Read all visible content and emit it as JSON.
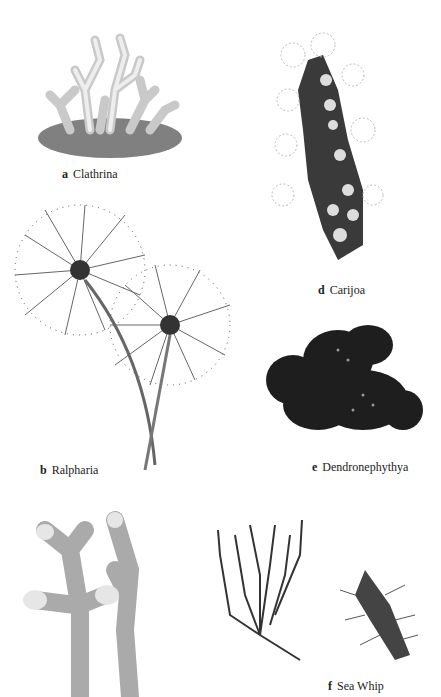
{
  "plates": [
    {
      "letter": "a",
      "name": "Clathrina"
    },
    {
      "letter": "b",
      "name": "Ralpharia"
    },
    {
      "letter": "d",
      "name": "Carijoa"
    },
    {
      "letter": "e",
      "name": "Dendronephythya"
    },
    {
      "letter": "f",
      "name": "Sea Whip"
    }
  ]
}
